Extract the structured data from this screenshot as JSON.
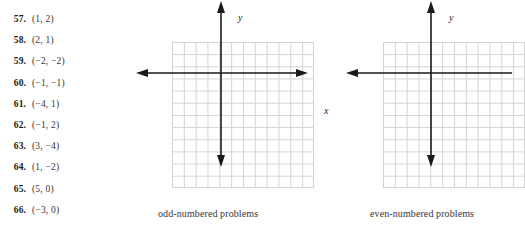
{
  "problems": [
    {
      "number": "57.",
      "pair": "(1, 2)"
    },
    {
      "number": "58.",
      "pair": "(2, 1)"
    },
    {
      "number": "59.",
      "pair": "(−2, −2)"
    },
    {
      "number": "60.",
      "pair": "(−1, −1)"
    },
    {
      "number": "61.",
      "pair": "(−4, 1)"
    },
    {
      "number": "62.",
      "pair": "(−1, 2)"
    },
    {
      "number": "63.",
      "pair": "(3, −4)"
    },
    {
      "number": "64.",
      "pair": "(1, −2)"
    },
    {
      "number": "65.",
      "pair": "(5, 0)"
    },
    {
      "number": "66.",
      "pair": "(−3, 0)"
    }
  ],
  "figures": {
    "odd": {
      "caption": "odd-numbered problems",
      "y_axis_label": "y",
      "x_axis_label": "x"
    },
    "even": {
      "caption": "even-numbered problems",
      "y_axis_label": "y"
    }
  },
  "chart_data": {
    "type": "scatter",
    "title": "",
    "xlabel": "x",
    "ylabel": "y",
    "grid": true,
    "legend": null,
    "xlim": [
      -6,
      6
    ],
    "ylim": [
      -6,
      6
    ],
    "grid_columns": 12,
    "grid_rows": 12,
    "points": [],
    "note": "Two empty 12x12 coordinate grids for plotting the listed ordered pairs",
    "panels": [
      {
        "caption": "odd-numbered problems",
        "points": [
          {
            "label": "57",
            "x": 1,
            "y": 2
          },
          {
            "label": "59",
            "x": -2,
            "y": -2
          },
          {
            "label": "61",
            "x": -4,
            "y": 1
          },
          {
            "label": "63",
            "x": 3,
            "y": -4
          },
          {
            "label": "65",
            "x": 5,
            "y": 0
          }
        ]
      },
      {
        "caption": "even-numbered problems",
        "points": [
          {
            "label": "58",
            "x": 2,
            "y": 1
          },
          {
            "label": "60",
            "x": -1,
            "y": -1
          },
          {
            "label": "62",
            "x": -1,
            "y": 2
          },
          {
            "label": "64",
            "x": 1,
            "y": -2
          },
          {
            "label": "66",
            "x": -3,
            "y": 0
          }
        ]
      }
    ]
  },
  "colors": {
    "background": "#ffffff",
    "grid_line": "#d6d2d2",
    "axis": "#1a1a1a",
    "number_text": "#201c1c",
    "body_text": "#3a3434"
  }
}
